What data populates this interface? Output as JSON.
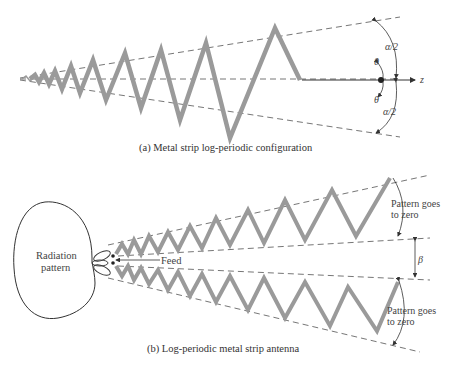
{
  "figure": {
    "part_a": {
      "caption": "(a)  Metal strip log-periodic configuration",
      "labels": {
        "alpha_half_top": "α/2",
        "alpha_half_bottom": "α/2",
        "theta_top": "θ",
        "theta_bottom": "θ",
        "z_axis": "z"
      }
    },
    "part_b": {
      "caption": "(b)  Log-periodic metal strip antenna",
      "labels": {
        "radiation_pattern_line1": "Radiation",
        "radiation_pattern_line2": "pattern",
        "feed": "Feed",
        "pattern_zero_top_line1": "Pattern goes",
        "pattern_zero_top_line2": "to zero",
        "beta": "β",
        "pattern_zero_bottom_line1": "Pattern goes",
        "pattern_zero_bottom_line2": "to zero"
      }
    },
    "colors": {
      "strip": "#9a9a9a",
      "dashed_line": "#666666",
      "ink": "#333333"
    }
  }
}
